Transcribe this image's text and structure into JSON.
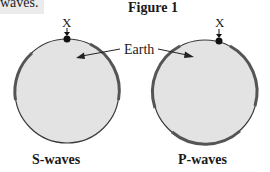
{
  "header": {
    "cropped_text": "waves.",
    "figure_title": "Figure 1"
  },
  "labels": {
    "left_point": "X",
    "right_point": "X",
    "earth": "Earth",
    "left_caption": "S-waves",
    "right_caption": "P-waves"
  },
  "diagram": {
    "circles": [
      {
        "name": "S-waves",
        "cx": 67,
        "cy": 91,
        "r": 52,
        "shaded_arcs": "left and right edges (shadow zone detection regions)"
      },
      {
        "name": "P-waves",
        "cx": 205,
        "cy": 92,
        "r": 52,
        "shaded_arcs": "left, right and bottom edges"
      }
    ],
    "colors": {
      "earth_fill": "#e3e3e3",
      "outline": "#3a3a3a",
      "shaded_arc": "#555555",
      "point": "#111111"
    }
  }
}
